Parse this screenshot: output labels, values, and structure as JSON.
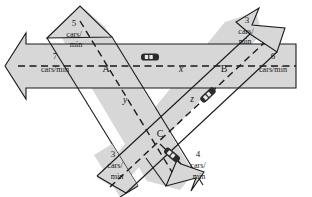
{
  "diagram": {
    "colors": {
      "road_fill": "#d7d7d7",
      "road_stroke": "#1a1a1a",
      "center_line": "#1a1a1a",
      "car_body": "#2b2b2b",
      "car_window": "#e8e8e8",
      "background": "#ffffff"
    },
    "nodes": [
      {
        "id": "A",
        "label": "A"
      },
      {
        "id": "B",
        "label": "B"
      },
      {
        "id": "C",
        "label": "C"
      }
    ],
    "flow_variables": [
      {
        "id": "x",
        "label": "x"
      },
      {
        "id": "y",
        "label": "y"
      },
      {
        "id": "z",
        "label": "z"
      }
    ],
    "units": "cars/min",
    "unit_line1": "cars/",
    "unit_line2": "min",
    "unit_inline": "cars/min",
    "flows": [
      {
        "id": "in-top-left",
        "value": "5",
        "unit": "cars/min",
        "direction": "in",
        "position": "top-left"
      },
      {
        "id": "out-top-right",
        "value": "3",
        "unit": "cars/min",
        "direction": "out",
        "position": "top-right"
      },
      {
        "id": "out-left",
        "value": "7",
        "unit": "cars/min",
        "direction": "out",
        "position": "left"
      },
      {
        "id": "in-right",
        "value": "6",
        "unit": "cars/min",
        "direction": "in",
        "position": "right"
      },
      {
        "id": "in-bottom-left",
        "value": "3",
        "unit": "cars/min",
        "direction": "in",
        "position": "bottom-left"
      },
      {
        "id": "out-bottom-right",
        "value": "4",
        "unit": "cars/min",
        "direction": "out",
        "position": "bottom-right"
      }
    ],
    "cars": [
      {
        "id": "car-horizontal",
        "rotation": 0
      },
      {
        "id": "car-diagonal-right",
        "rotation": -48
      },
      {
        "id": "car-diagonal-left",
        "rotation": 41
      }
    ]
  }
}
